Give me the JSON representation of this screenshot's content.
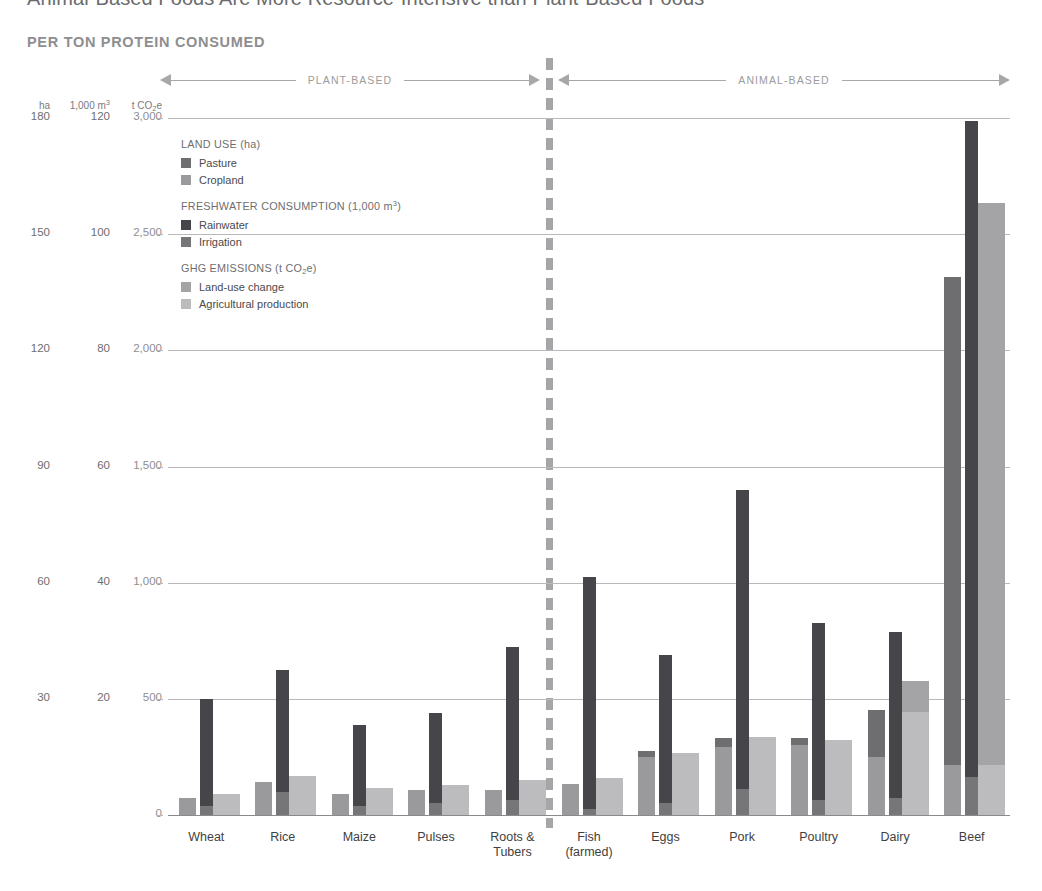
{
  "title": "Animal-Based Foods Are More Resource-Intensive than Plant-Based Foods",
  "subtitle": "PER TON PROTEIN CONSUMED",
  "bands": {
    "plant": "PLANT-BASED",
    "animal": "ANIMAL-BASED"
  },
  "axis_units": {
    "ha": "ha",
    "water": "1,000 m³",
    "ghg": "t CO₂e"
  },
  "legend": [
    {
      "heading": "LAND USE (ha)",
      "items": [
        {
          "label": "Pasture",
          "color": "#6e6e70"
        },
        {
          "label": "Cropland",
          "color": "#9a9a9c"
        }
      ]
    },
    {
      "heading": "FRESHWATER CONSUMPTION (1,000 m³)",
      "items": [
        {
          "label": "Rainwater",
          "color": "#45454a"
        },
        {
          "label": "Irrigation",
          "color": "#767678"
        }
      ]
    },
    {
      "heading": "GHG EMISSIONS (t CO₂e)",
      "items": [
        {
          "label": "Land-use change",
          "color": "#a4a4a6"
        },
        {
          "label": "Agricultural production",
          "color": "#bcbcbe"
        }
      ]
    }
  ],
  "colors": {
    "pasture": "#6e6e70",
    "cropland": "#9a9a9c",
    "rainwater": "#45454a",
    "irrigation": "#767678",
    "land_use_change": "#a4a4a6",
    "agricultural_production": "#bcbcbe",
    "grid": "#b9b9bb",
    "divider": "#a6a6a8",
    "text": "#58585a"
  },
  "chart_data": {
    "type": "bar",
    "title": "Animal-Based Foods Are More Resource-Intensive than Plant-Based Foods",
    "subtitle": "PER TON PROTEIN CONSUMED",
    "grid": true,
    "legend_position": "inside-top-left",
    "xlabel": "",
    "categories": [
      "Wheat",
      "Rice",
      "Maize",
      "Pulses",
      "Roots & Tubers",
      "Fish (farmed)",
      "Eggs",
      "Pork",
      "Poultry",
      "Dairy",
      "Beef"
    ],
    "category_lines": [
      [
        "Wheat"
      ],
      [
        "Rice"
      ],
      [
        "Maize"
      ],
      [
        "Pulses"
      ],
      [
        "Roots &",
        "Tubers"
      ],
      [
        "Fish",
        "(farmed)"
      ],
      [
        "Eggs"
      ],
      [
        "Pork"
      ],
      [
        "Poultry"
      ],
      [
        "Dairy"
      ],
      [
        "Beef"
      ]
    ],
    "groups": [
      "plant-based",
      "plant-based",
      "plant-based",
      "plant-based",
      "plant-based",
      "animal-based",
      "animal-based",
      "animal-based",
      "animal-based",
      "animal-based",
      "animal-based"
    ],
    "axes": [
      {
        "name": "Land use",
        "unit": "ha",
        "ylim": [
          0,
          180
        ],
        "ticks": [
          0,
          30,
          60,
          90,
          120,
          150,
          180
        ]
      },
      {
        "name": "Freshwater consumption",
        "unit": "1,000 m³",
        "ylim": [
          0,
          120
        ],
        "ticks": [
          0,
          20,
          40,
          60,
          80,
          100,
          120
        ]
      },
      {
        "name": "GHG emissions",
        "unit": "t CO₂e",
        "ylim": [
          0,
          3000
        ],
        "ticks": [
          0,
          500,
          1000,
          1500,
          2000,
          2500,
          3000
        ]
      }
    ],
    "tick_labels": [
      {
        "ha": "180",
        "water": "120",
        "ghg": "3,000"
      },
      {
        "ha": "150",
        "water": "100",
        "ghg": "2,500"
      },
      {
        "ha": "120",
        "water": "80",
        "ghg": "2,000"
      },
      {
        "ha": "90",
        "water": "60",
        "ghg": "1,500"
      },
      {
        "ha": "60",
        "water": "40",
        "ghg": "1,000"
      },
      {
        "ha": "30",
        "water": "20",
        "ghg": "500"
      },
      {
        "ha": "",
        "water": "",
        "ghg": "0"
      }
    ],
    "series": [
      {
        "name": "Pasture",
        "axis": "ha",
        "unit": "ha",
        "values": [
          0,
          0,
          0,
          0,
          0,
          0,
          1.5,
          2.5,
          2.0,
          12.0,
          126.0
        ]
      },
      {
        "name": "Cropland",
        "axis": "ha",
        "unit": "ha",
        "values": [
          4.5,
          8.5,
          5.5,
          6.5,
          6.5,
          8.0,
          15.0,
          17.5,
          18.0,
          15.0,
          13.0
        ]
      },
      {
        "name": "Rainwater",
        "axis": "water",
        "unit": "1,000 m³",
        "values": [
          18.5,
          21.0,
          14.0,
          15.5,
          26.5,
          40.0,
          25.5,
          51.5,
          30.5,
          28.5,
          113.0
        ]
      },
      {
        "name": "Irrigation",
        "axis": "water",
        "unit": "1,000 m³",
        "values": [
          1.5,
          4.0,
          1.5,
          2.0,
          2.5,
          1.0,
          2.0,
          4.5,
          2.5,
          3.0,
          6.5
        ]
      },
      {
        "name": "Land-use change",
        "axis": "ghg",
        "unit": "t CO₂e",
        "values": [
          0,
          0,
          0,
          0,
          0,
          0,
          0,
          0,
          0,
          130,
          2420
        ]
      },
      {
        "name": "Agricultural production",
        "axis": "ghg",
        "unit": "t CO₂e",
        "values": [
          90,
          170,
          115,
          130,
          150,
          160,
          265,
          335,
          325,
          445,
          215
        ]
      }
    ]
  }
}
